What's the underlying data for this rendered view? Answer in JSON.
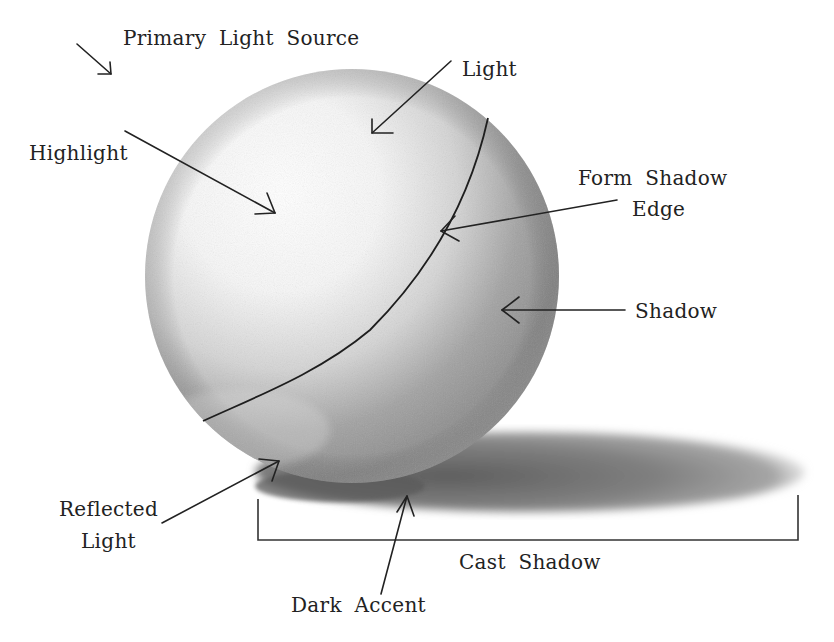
{
  "labels": {
    "primary_light_source": "Primary Light Source",
    "light": "Light",
    "highlight": "Highlight",
    "form_shadow_edge_line1": "Form Shadow",
    "form_shadow_edge_line2": "Edge",
    "shadow": "Shadow",
    "reflected_light_line1": "Reflected",
    "reflected_light_line2": "Light",
    "cast_shadow": "Cast Shadow",
    "dark_accent": "Dark Accent"
  },
  "colors": {
    "text": "#222222",
    "background": "#ffffff",
    "sphere_light": "#f7f7f7",
    "sphere_shadow": "#8a8a8a",
    "cast_shadow": "#7a7a7a"
  }
}
